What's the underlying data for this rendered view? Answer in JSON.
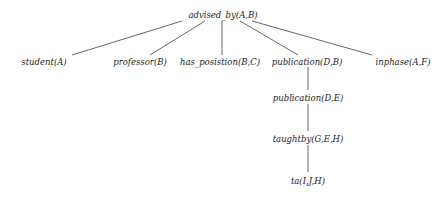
{
  "diagram": {
    "type": "tree",
    "root": "advised_by(A,B)",
    "nodes": [
      {
        "id": "n0",
        "label": "advised_by(A,B)"
      },
      {
        "id": "n1",
        "label": "student(A)"
      },
      {
        "id": "n2",
        "label": "professor(B)"
      },
      {
        "id": "n3",
        "label": "has_posistion(B,C)"
      },
      {
        "id": "n4",
        "label": "publication(D,B)"
      },
      {
        "id": "n5",
        "label": "inphase(A,F)"
      },
      {
        "id": "n6",
        "label": "publication(D,E)"
      },
      {
        "id": "n7",
        "label": "taughtby(G,E,H)"
      },
      {
        "id": "n8",
        "label": "ta(I,J,H)"
      }
    ],
    "edges": [
      {
        "from": "n0",
        "to": "n1"
      },
      {
        "from": "n0",
        "to": "n2"
      },
      {
        "from": "n0",
        "to": "n3"
      },
      {
        "from": "n0",
        "to": "n4"
      },
      {
        "from": "n0",
        "to": "n5"
      },
      {
        "from": "n4",
        "to": "n6"
      },
      {
        "from": "n6",
        "to": "n7"
      },
      {
        "from": "n7",
        "to": "n8"
      }
    ]
  }
}
